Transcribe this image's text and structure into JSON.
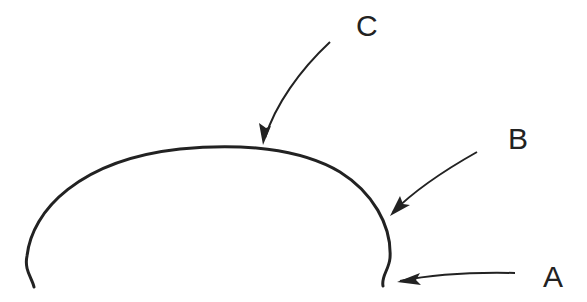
{
  "diagram": {
    "type": "labeled-profile-curve",
    "stroke_color": "#222222",
    "background": "#ffffff",
    "labels": {
      "a": "A",
      "b": "B",
      "c": "C"
    },
    "callouts": [
      {
        "label": "C",
        "points_to": "top (crown) of curve"
      },
      {
        "label": "B",
        "points_to": "right shoulder of curve"
      },
      {
        "label": "A",
        "points_to": "right base hook of curve"
      }
    ]
  }
}
